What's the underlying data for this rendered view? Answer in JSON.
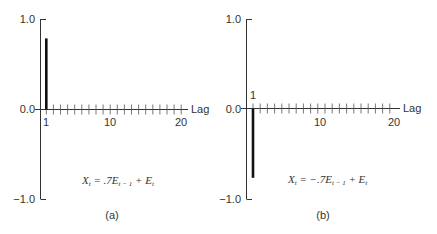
{
  "chart_data": [
    {
      "type": "bar",
      "panel": "(a)",
      "title": "",
      "xlabel": "Lag",
      "ylabel": "",
      "ylim": [
        -1.0,
        1.0
      ],
      "yticks": [
        "1.0",
        "0.0",
        "-1.0"
      ],
      "xticks_labeled": [
        "1",
        "10",
        "20"
      ],
      "x": [
        1,
        2,
        3,
        4,
        5,
        6,
        7,
        8,
        9,
        10,
        11,
        12,
        13,
        14,
        15,
        16,
        17,
        18,
        19,
        20
      ],
      "values": [
        0.79,
        0,
        0,
        0,
        0,
        0,
        0,
        0,
        0,
        0,
        0,
        0,
        0,
        0,
        0,
        0,
        0,
        0,
        0,
        0
      ],
      "annotation": "X_t = .7E_{t-1} + E_t",
      "grid": false
    },
    {
      "type": "bar",
      "panel": "(b)",
      "title": "",
      "xlabel": "Lag",
      "ylabel": "",
      "ylim": [
        -1.0,
        1.0
      ],
      "yticks": [
        "1.0",
        "0.0",
        "-1.0"
      ],
      "xticks_labeled": [
        "1",
        "10",
        "20"
      ],
      "x": [
        1,
        2,
        3,
        4,
        5,
        6,
        7,
        8,
        9,
        10,
        11,
        12,
        13,
        14,
        15,
        16,
        17,
        18,
        19,
        20
      ],
      "values": [
        -0.77,
        0,
        0,
        0,
        0,
        0,
        0,
        0,
        0,
        0,
        0,
        0,
        0,
        0,
        0,
        0,
        0,
        0,
        0,
        0
      ],
      "annotation": "X_t = -.7E_{t-1} + E_t",
      "grid": false
    }
  ],
  "panels": {
    "a": {
      "ytick_top": "1.0",
      "ytick_mid": "0.0",
      "ytick_bot": "−1.0",
      "xlabel": "Lag",
      "xtick_1": "1",
      "xtick_10": "10",
      "xtick_20": "20",
      "formula_X": "X",
      "formula_sub_t": "t",
      "formula_mid": " = .7E",
      "formula_sub_t1": "t − 1",
      "formula_end": " + E",
      "formula_sub_t2": "t",
      "caption": "(a)"
    },
    "b": {
      "ytick_top": "1.0",
      "ytick_mid": "0.0",
      "ytick_bot": "−1.0",
      "xlabel": "Lag",
      "xtick_1": "1",
      "xtick_10": "10",
      "xtick_20": "20",
      "formula_X": "X",
      "formula_sub_t": "t",
      "formula_mid": " = −.7E",
      "formula_sub_t1": "t − 1",
      "formula_end": " + E",
      "formula_sub_t2": "t",
      "caption": "(b)"
    }
  }
}
